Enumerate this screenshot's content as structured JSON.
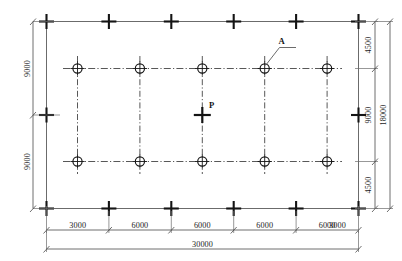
{
  "drawing": {
    "title": "Structural Column Grid Plan",
    "units": "mm",
    "overall_width": "30000",
    "overall_height": "18000",
    "bottom_dimension_chain": {
      "name": "bottom-dimension-chain",
      "segments": [
        "3000",
        "6000",
        "6000",
        "6000",
        "6000",
        "3000"
      ],
      "total": "30000"
    },
    "left_dimension_chain": {
      "name": "left-dimension-chain",
      "segments": [
        "9000",
        "9000"
      ]
    },
    "right_inner_dimension_chain": {
      "name": "right-inner-dimension-chain",
      "segments": [
        "4500",
        "9000",
        "4500"
      ]
    },
    "right_outer_dimension": {
      "name": "right-outer-dimension",
      "total": "18000"
    },
    "annotations": [
      {
        "id": "A",
        "label": "A",
        "target": "column-circle-top-row-4"
      },
      {
        "id": "P",
        "label": "P",
        "target": "load-point-marker"
      }
    ],
    "colors": {
      "structure_line": "#6b6b6b",
      "cross_marker": "#141414",
      "centerline": "#3a3a3a",
      "dimension_line": "#4a4a4a",
      "background": "#ffffff"
    },
    "grid": {
      "top_row_columns": 5,
      "bottom_row_columns": 5,
      "edge_crosses_top": 6,
      "edge_crosses_bottom": 6,
      "edge_crosses_side": 1
    }
  }
}
